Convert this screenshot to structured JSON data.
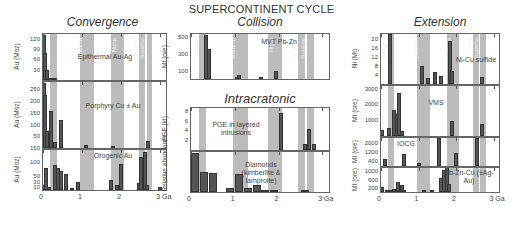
{
  "title": "SUPERCONTINENT CYCLE",
  "columns": [
    {
      "name": "Convergence"
    },
    {
      "name": "Collision"
    },
    {
      "name": "Intracratonic"
    },
    {
      "name": "Extension"
    }
  ],
  "supercontinents": [
    "Pangea",
    "Rodinia",
    "Nuna",
    "Sclavia",
    "Superia"
  ],
  "x_axis": {
    "ticks": [
      "0",
      "1",
      "2",
      "3 Ga"
    ]
  },
  "chart_data": [
    {
      "type": "bar",
      "title": "Epithermal Au-Ag",
      "group": "Convergence",
      "ylabel": "Au (Moz)",
      "yticks": [
        30,
        60,
        90,
        120
      ],
      "ylim": [
        0,
        140
      ],
      "x": [
        0.02,
        0.05,
        0.1,
        0.2,
        0.25,
        0.3
      ],
      "values": [
        135,
        80,
        30,
        5,
        3,
        2
      ]
    },
    {
      "type": "bar",
      "title": "Porphyry Cu ± Au",
      "group": "Convergence",
      "ylabel": "Au (Moz)",
      "ylabel2": "Cu (Mt)",
      "yticks": [
        50,
        100,
        150,
        200,
        250
      ],
      "yticks2": [
        50,
        100,
        150,
        200,
        250
      ],
      "ylim": [
        0,
        290
      ],
      "x": [
        0.02,
        0.05,
        0.1,
        0.2,
        0.3,
        0.45,
        1.1,
        1.8,
        2.7
      ],
      "values": [
        280,
        230,
        75,
        160,
        25,
        120,
        15,
        8,
        30
      ]
    },
    {
      "type": "bar",
      "title": "Orogenic Au",
      "group": "Convergence",
      "ylabel": "Au (Moz)",
      "yticks": [
        10,
        30,
        50,
        100,
        150
      ],
      "ylim": [
        0,
        150
      ],
      "x": [
        0.02,
        0.08,
        0.15,
        0.3,
        0.38,
        0.45,
        0.6,
        0.75,
        0.9,
        1.75,
        1.9,
        2.0,
        2.45,
        2.5,
        2.6,
        2.65,
        3.0
      ],
      "values": [
        20,
        80,
        10,
        90,
        80,
        70,
        60,
        5,
        30,
        35,
        20,
        95,
        25,
        120,
        140,
        20,
        12
      ]
    },
    {
      "type": "bar",
      "title": "MVT Pb-Zn",
      "group": "Collision",
      "ylabel": "Mt (ore)",
      "yticks": [
        100,
        300,
        500
      ],
      "ylim": [
        0,
        560
      ],
      "x": [
        0.35,
        0.42,
        1.05,
        1.1,
        1.6,
        1.95
      ],
      "values": [
        530,
        370,
        30,
        50,
        20,
        100
      ]
    },
    {
      "type": "bar",
      "title": "PGE in layered intrusions",
      "group": "Intracratonic",
      "ylabel": "PGE (kt)",
      "yticks": [
        2,
        4,
        6,
        8
      ],
      "ylim": [
        0,
        9
      ],
      "x": [
        2.05,
        2.6,
        2.7,
        2.8
      ],
      "values": [
        7.8,
        1.2,
        4.3,
        1.2
      ]
    },
    {
      "type": "bar",
      "title": "Diamonds (kimberlite & lamproite)",
      "group": "Intracratonic",
      "ylabel": "Relative abundance",
      "x": [
        0.1,
        0.3,
        0.5,
        0.9,
        1.1,
        1.3,
        1.5,
        1.7,
        1.9,
        2.6
      ],
      "values": [
        100,
        50,
        48,
        10,
        45,
        10,
        18,
        5,
        4,
        3
      ]
    },
    {
      "type": "bar",
      "title": "Ni-Cu sulfide",
      "group": "Extension",
      "ylabel": "Ni (Mt)",
      "yticks": [
        4,
        8,
        12,
        16,
        20
      ],
      "ylim": [
        0,
        23
      ],
      "x": [
        0.25,
        1.1,
        1.25,
        1.45,
        1.6,
        1.85,
        1.9,
        2.7
      ],
      "values": [
        22.5,
        8,
        2.5,
        5.5,
        3.5,
        19.5,
        6,
        3
      ]
    },
    {
      "type": "bar",
      "title": "VMS",
      "group": "Extension",
      "ylabel": "Mt (ore)",
      "yticks": [
        1000,
        2000,
        3000
      ],
      "ylim": [
        0,
        3300
      ],
      "x": [
        0.02,
        0.2,
        0.35,
        0.42,
        0.48,
        0.55,
        1.9,
        2.7
      ],
      "values": [
        400,
        500,
        1700,
        1400,
        2800,
        300,
        1000,
        800
      ]
    },
    {
      "type": "bar",
      "title": "IOCG",
      "group": "Extension",
      "ylabel": "Mt (ore)",
      "yticks": [
        400,
        1200,
        2000
      ],
      "ylim": [
        0,
        2600
      ],
      "x": [
        0.1,
        0.6,
        1.0,
        1.55,
        2.0,
        2.55
      ],
      "values": [
        600,
        1050,
        300,
        2550,
        1150,
        2550
      ]
    },
    {
      "type": "bar",
      "title": "Pb-Zn-Cu (±Ag-Au)",
      "group": "Extension",
      "ylabel": "Mt (ore)",
      "yticks": [
        200,
        600,
        1000
      ],
      "ylim": [
        0,
        1250
      ],
      "x": [
        0.02,
        0.15,
        0.25,
        0.35,
        0.45,
        0.55,
        0.62,
        1.15,
        1.35,
        1.6,
        1.68,
        1.75,
        1.82
      ],
      "values": [
        250,
        80,
        120,
        160,
        520,
        360,
        50,
        50,
        80,
        680,
        1100,
        1250,
        380
      ]
    }
  ]
}
